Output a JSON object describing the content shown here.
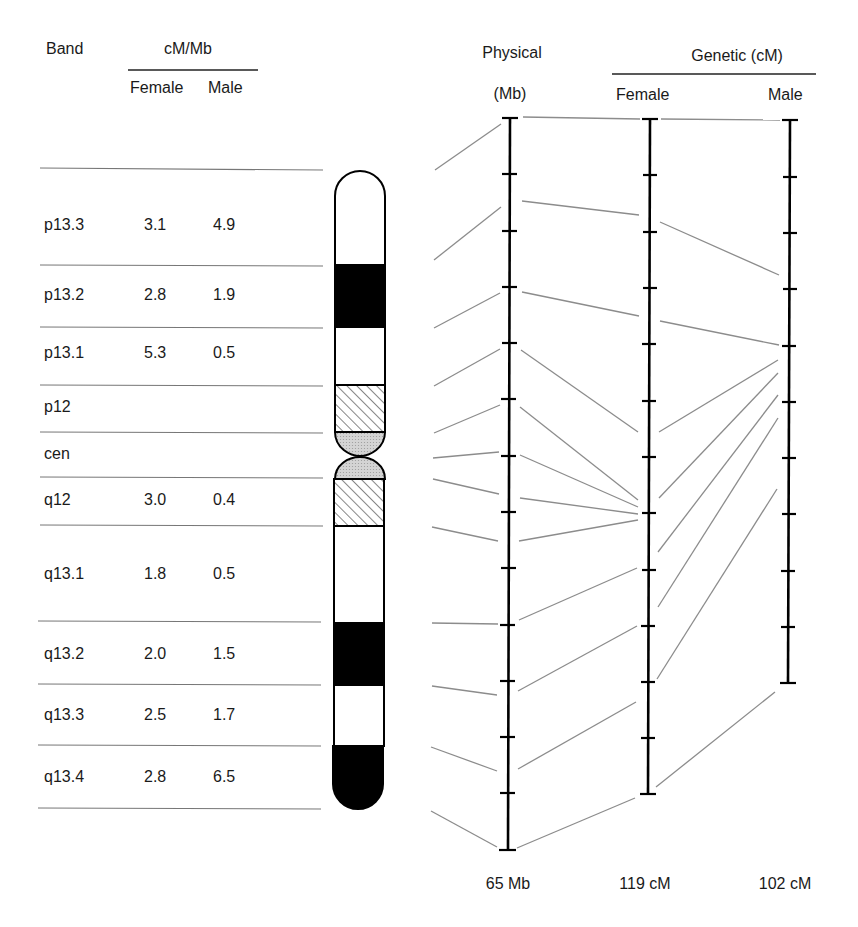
{
  "table": {
    "band_header": "Band",
    "rate_header": "cM/Mb",
    "female_header": "Female",
    "male_header": "Male",
    "rows": [
      {
        "band": "p13.3",
        "female": "3.1",
        "male": "4.9"
      },
      {
        "band": "p13.2",
        "female": "2.8",
        "male": "1.9"
      },
      {
        "band": "p13.1",
        "female": "5.3",
        "male": "0.5"
      },
      {
        "band": "p12",
        "female": "",
        "male": ""
      },
      {
        "band": "cen",
        "female": "",
        "male": ""
      },
      {
        "band": "q12",
        "female": "3.0",
        "male": "0.4"
      },
      {
        "band": "q13.1",
        "female": "1.8",
        "male": "0.5"
      },
      {
        "band": "q13.2",
        "female": "2.0",
        "male": "1.5"
      },
      {
        "band": "q13.3",
        "female": "2.5",
        "male": "1.7"
      },
      {
        "band": "q13.4",
        "female": "2.8",
        "male": "6.5"
      }
    ]
  },
  "maps": {
    "physical_header": "Physical",
    "physical_unit": "(Mb)",
    "genetic_header": "Genetic (cM)",
    "female_header": "Female",
    "male_header": "Male",
    "physical_total": "65 Mb",
    "female_total": "119 cM",
    "male_total": "102 cM"
  },
  "chromosome": {
    "bands": [
      {
        "name": "p13.3",
        "stain": "white"
      },
      {
        "name": "p13.2",
        "stain": "black"
      },
      {
        "name": "p13.1",
        "stain": "white"
      },
      {
        "name": "p12",
        "stain": "hatched"
      },
      {
        "name": "cen",
        "stain": "stippled"
      },
      {
        "name": "q12",
        "stain": "hatched"
      },
      {
        "name": "q13.1",
        "stain": "white"
      },
      {
        "name": "q13.2",
        "stain": "black"
      },
      {
        "name": "q13.3",
        "stain": "white"
      },
      {
        "name": "q13.4",
        "stain": "black"
      }
    ]
  },
  "colors": {
    "axis": "#000000",
    "connector": "#8c8c8c",
    "rule": "#777777",
    "stipple": "#cfcfcf"
  }
}
